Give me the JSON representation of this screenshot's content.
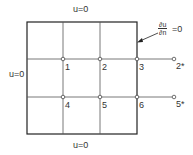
{
  "diagram": {
    "type": "finite-difference grid with boundary conditions",
    "boundary_labels": {
      "top": "u=0",
      "left": "u=0",
      "bottom": "u=0",
      "right_numerator": "∂u",
      "right_denominator": "∂n",
      "right_rhs": "=0"
    },
    "nodes": [
      {
        "id": "1",
        "label": "1"
      },
      {
        "id": "2",
        "label": "2"
      },
      {
        "id": "3",
        "label": "3"
      },
      {
        "id": "4",
        "label": "4"
      },
      {
        "id": "5",
        "label": "5"
      },
      {
        "id": "6",
        "label": "6"
      }
    ],
    "ghost_nodes": [
      {
        "id": "2*",
        "label": "2*"
      },
      {
        "id": "5*",
        "label": "5*"
      }
    ],
    "colors": {
      "line": "#222222",
      "grid": "#555555",
      "node_fill": "#ffffff"
    }
  }
}
